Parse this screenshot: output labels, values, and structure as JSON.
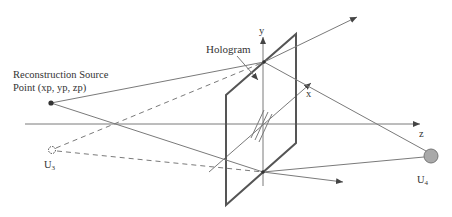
{
  "diagram": {
    "labels": {
      "hologram": "Hologram",
      "source_line1": "Reconstruction Source",
      "source_line2": "Point (xp, yp, zp)",
      "axis_x": "x",
      "axis_y": "y",
      "axis_z": "z",
      "u3_main": "U",
      "u3_sub": "3",
      "u4_main": "U",
      "u4_sub": "4"
    },
    "colors": {
      "line": "#7a7a7a",
      "plate": "#555555",
      "u4_fill": "#a9a9a9",
      "text": "#333333"
    },
    "nodes": [
      {
        "id": "source",
        "x": 51,
        "y": 103,
        "style": "filled-dot"
      },
      {
        "id": "U3",
        "x": 52,
        "y": 150,
        "style": "dashed-circle"
      },
      {
        "id": "U4",
        "x": 431,
        "y": 156,
        "style": "gray-circle"
      },
      {
        "id": "hologram_top_point",
        "x": 264,
        "y": 62
      },
      {
        "id": "hologram_bottom_point",
        "x": 263,
        "y": 172
      }
    ]
  }
}
